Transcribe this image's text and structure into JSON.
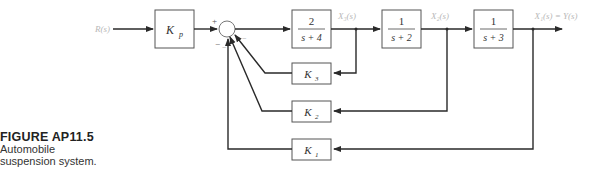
{
  "caption": {
    "figure_label": "FIGURE AP11.5",
    "line1": "Automobile",
    "line2": "suspension system."
  },
  "signals": {
    "input": "R(s)",
    "x3": "X₃(s)",
    "x2": "X₂(s)",
    "output": "X₁(s) = Y(s)"
  },
  "blocks": {
    "kp": {
      "name": "K",
      "sub": "p"
    },
    "g1": {
      "num": "2",
      "den": "s + 4"
    },
    "g2": {
      "num": "1",
      "den": "s + 2"
    },
    "g3": {
      "num": "1",
      "den": "s + 3"
    },
    "k3": {
      "name": "K",
      "sub": "3"
    },
    "k2": {
      "name": "K",
      "sub": "2"
    },
    "k1": {
      "name": "K",
      "sub": "1"
    }
  },
  "summer": {
    "signs": {
      "top": "+",
      "left_bottom": "−",
      "right_bottom": "−",
      "bottom": "−"
    }
  },
  "colors": {
    "line": "#2a2a2a",
    "block_border": "#555555",
    "signal_label": "#b8b8b8"
  }
}
